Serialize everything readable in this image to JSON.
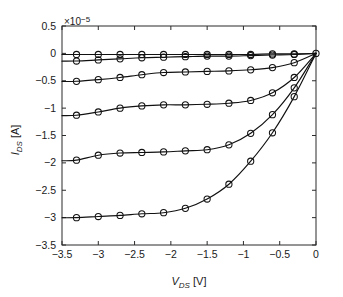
{
  "chart_data": {
    "type": "line",
    "title": "",
    "subtitle": "",
    "xlabel": "V_DS [V]",
    "xlabel_symbol": "V",
    "xlabel_sub": "DS",
    "xlabel_unit": "[V]",
    "ylabel": "I_DS [A]",
    "ylabel_symbol": "I",
    "ylabel_sub": "DS",
    "ylabel_unit": "[A]",
    "y_exponent_label": "×10",
    "y_exponent_power": "−5",
    "y_scale_factor": 1e-05,
    "xlim": [
      -3.5,
      0
    ],
    "ylim": [
      -3.5,
      0.5
    ],
    "xticks": [
      -3.5,
      -3,
      -2.5,
      -2,
      -1.5,
      -1,
      -0.5,
      0
    ],
    "xtick_labels": [
      "−3.5",
      "−3",
      "−2.5",
      "−2",
      "−1.5",
      "−1",
      "−0.5",
      "0"
    ],
    "yticks": [
      0.5,
      0,
      -0.5,
      -1,
      -1.5,
      -2,
      -2.5,
      -3,
      -3.5
    ],
    "ytick_labels": [
      "0.5",
      "0",
      "−0.5",
      "−1",
      "−1.5",
      "−2",
      "−2.5",
      "−3",
      "−3.5"
    ],
    "grid": false,
    "legend": "none",
    "marker_shape": "circle",
    "line_color": "#111111",
    "marker_color": "#111111",
    "x_marker_positions": [
      -3.3,
      -3.0,
      -2.7,
      -2.4,
      -2.1,
      -1.8,
      -1.5,
      -1.2,
      -0.9,
      -0.6,
      -0.3,
      0
    ],
    "series": [
      {
        "name": "curve-1",
        "values": [
          -0.02,
          -0.02,
          -0.02,
          -0.02,
          -0.02,
          -0.02,
          -0.02,
          -0.02,
          -0.02,
          -0.01,
          -0.01,
          0
        ]
      },
      {
        "name": "curve-2",
        "values": [
          -0.14,
          -0.12,
          -0.1,
          -0.08,
          -0.07,
          -0.06,
          -0.05,
          -0.05,
          -0.04,
          -0.03,
          -0.02,
          0
        ]
      },
      {
        "name": "curve-3",
        "values": [
          -0.51,
          -0.48,
          -0.44,
          -0.39,
          -0.35,
          -0.34,
          -0.33,
          -0.32,
          -0.3,
          -0.26,
          -0.17,
          0
        ]
      },
      {
        "name": "curve-4",
        "values": [
          -1.13,
          -1.07,
          -1.0,
          -0.96,
          -0.94,
          -0.94,
          -0.93,
          -0.91,
          -0.86,
          -0.72,
          -0.44,
          0
        ]
      },
      {
        "name": "curve-5",
        "values": [
          -1.95,
          -1.86,
          -1.82,
          -1.81,
          -1.8,
          -1.78,
          -1.76,
          -1.67,
          -1.46,
          -1.12,
          -0.63,
          0
        ]
      },
      {
        "name": "curve-6",
        "values": [
          -3.0,
          -2.98,
          -2.96,
          -2.93,
          -2.91,
          -2.83,
          -2.66,
          -2.39,
          -1.97,
          -1.45,
          -0.79,
          0
        ]
      }
    ]
  }
}
